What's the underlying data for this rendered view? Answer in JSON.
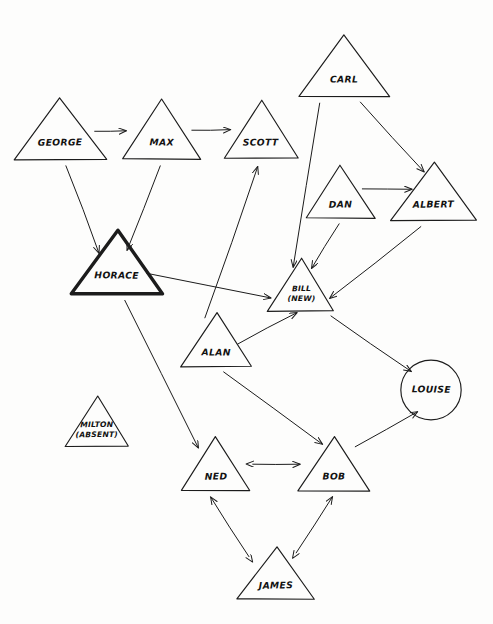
{
  "diagram": {
    "kind": "hand-drawn-sociogram",
    "background_color": "#fdfdfc",
    "ink_color": "#1c1c1c",
    "highlight_stroke_color": "#1c1c1c",
    "nodes": [
      {
        "id": "george",
        "label": "GEORGE",
        "label2": "",
        "shape": "triangle",
        "cx": 60,
        "cy": 135,
        "half_width": 46,
        "height": 62,
        "highlight": false
      },
      {
        "id": "max",
        "label": "MAX",
        "label2": "",
        "shape": "triangle",
        "cx": 162,
        "cy": 135,
        "half_width": 39,
        "height": 60,
        "highlight": false
      },
      {
        "id": "scott",
        "label": "SCOTT",
        "label2": "",
        "shape": "triangle",
        "cx": 261,
        "cy": 135,
        "half_width": 37,
        "height": 58,
        "highlight": false
      },
      {
        "id": "carl",
        "label": "CARL",
        "label2": "",
        "shape": "triangle",
        "cx": 344,
        "cy": 72,
        "half_width": 45,
        "height": 62,
        "highlight": false
      },
      {
        "id": "dan",
        "label": "DAN",
        "label2": "",
        "shape": "triangle",
        "cx": 341,
        "cy": 197,
        "half_width": 34,
        "height": 53,
        "highlight": false
      },
      {
        "id": "albert",
        "label": "ALBERT",
        "label2": "",
        "shape": "triangle",
        "cx": 434,
        "cy": 197,
        "half_width": 43,
        "height": 58,
        "highlight": false
      },
      {
        "id": "horace",
        "label": "HORACE",
        "label2": "",
        "shape": "triangle",
        "cx": 117,
        "cy": 268,
        "half_width": 45,
        "height": 63,
        "highlight": true
      },
      {
        "id": "bill",
        "label": "BILL",
        "label2": "(NEW)",
        "shape": "triangle",
        "cx": 301,
        "cy": 290,
        "half_width": 33,
        "height": 53,
        "highlight": false
      },
      {
        "id": "alan",
        "label": "ALAN",
        "label2": "",
        "shape": "triangle",
        "cx": 216,
        "cy": 345,
        "half_width": 35,
        "height": 54,
        "highlight": false
      },
      {
        "id": "louise",
        "label": "LOUISE",
        "label2": "",
        "shape": "circle",
        "cx": 431,
        "cy": 390,
        "radius": 30,
        "highlight": false
      },
      {
        "id": "milton",
        "label": "MILTON",
        "label2": "(ABSENT)",
        "shape": "triangle",
        "cx": 97,
        "cy": 426,
        "half_width": 32,
        "height": 50,
        "highlight": false
      },
      {
        "id": "ned",
        "label": "NED",
        "label2": "",
        "shape": "triangle",
        "cx": 216,
        "cy": 469,
        "half_width": 34,
        "height": 54,
        "highlight": false
      },
      {
        "id": "bob",
        "label": "BOB",
        "label2": "",
        "shape": "triangle",
        "cx": 334,
        "cy": 469,
        "half_width": 36,
        "height": 54,
        "highlight": false
      },
      {
        "id": "james",
        "label": "JAMES",
        "label2": "",
        "shape": "triangle",
        "cx": 276,
        "cy": 578,
        "half_width": 39,
        "height": 52,
        "highlight": false
      }
    ],
    "edges": [
      {
        "id": "george-max",
        "from": "george",
        "to": "max",
        "direction": "one-way",
        "x1": 95,
        "y1": 131,
        "x2": 126,
        "y2": 131
      },
      {
        "id": "max-scott",
        "from": "max",
        "to": "scott",
        "direction": "one-way",
        "x1": 192,
        "y1": 130,
        "x2": 230,
        "y2": 130
      },
      {
        "id": "george-horace",
        "from": "george",
        "to": "horace",
        "direction": "one-way",
        "x1": 66,
        "y1": 166,
        "x2": 99,
        "y2": 253
      },
      {
        "id": "max-horace",
        "from": "max",
        "to": "horace",
        "direction": "one-way",
        "x1": 160,
        "y1": 166,
        "x2": 127,
        "y2": 250
      },
      {
        "id": "carl-albert",
        "from": "carl",
        "to": "albert",
        "direction": "one-way",
        "x1": 360,
        "y1": 102,
        "x2": 424,
        "y2": 172
      },
      {
        "id": "carl-bill",
        "from": "carl",
        "to": "bill",
        "direction": "one-way",
        "x1": 320,
        "y1": 103,
        "x2": 293,
        "y2": 267
      },
      {
        "id": "dan-albert",
        "from": "dan",
        "to": "albert",
        "direction": "one-way",
        "x1": 362,
        "y1": 189,
        "x2": 412,
        "y2": 189
      },
      {
        "id": "dan-bill",
        "from": "dan",
        "to": "bill",
        "direction": "one-way",
        "x1": 339,
        "y1": 224,
        "x2": 312,
        "y2": 268
      },
      {
        "id": "albert-bill",
        "from": "albert",
        "to": "bill",
        "direction": "one-way",
        "x1": 421,
        "y1": 227,
        "x2": 330,
        "y2": 298
      },
      {
        "id": "horace-bill",
        "from": "horace",
        "to": "bill",
        "direction": "one-way",
        "x1": 147,
        "y1": 273,
        "x2": 271,
        "y2": 298
      },
      {
        "id": "horace-ned",
        "from": "horace",
        "to": "ned",
        "direction": "one-way",
        "x1": 125,
        "y1": 300,
        "x2": 198,
        "y2": 448
      },
      {
        "id": "alan-scott",
        "from": "alan",
        "to": "scott",
        "direction": "one-way",
        "x1": 205,
        "y1": 318,
        "x2": 258,
        "y2": 167
      },
      {
        "id": "alan-bill",
        "from": "alan",
        "to": "bill",
        "direction": "one-way",
        "x1": 238,
        "y1": 344,
        "x2": 297,
        "y2": 313
      },
      {
        "id": "alan-bob",
        "from": "alan",
        "to": "bob",
        "direction": "one-way",
        "x1": 224,
        "y1": 372,
        "x2": 322,
        "y2": 444
      },
      {
        "id": "bill-louise",
        "from": "bill",
        "to": "louise",
        "direction": "one-way",
        "x1": 331,
        "y1": 316,
        "x2": 411,
        "y2": 371
      },
      {
        "id": "bob-louise",
        "from": "bob",
        "to": "louise",
        "direction": "one-way",
        "x1": 355,
        "y1": 447,
        "x2": 417,
        "y2": 412
      },
      {
        "id": "ned-bob",
        "from": "ned",
        "to": "bob",
        "direction": "two-way",
        "x1": 253,
        "y1": 464,
        "x2": 300,
        "y2": 464
      },
      {
        "id": "james-ned",
        "from": "james",
        "to": "ned",
        "direction": "two-way",
        "x1": 249,
        "y1": 557,
        "x2": 211,
        "y2": 497
      },
      {
        "id": "james-bob",
        "from": "james",
        "to": "bob",
        "direction": "two-way",
        "x1": 296,
        "y1": 553,
        "x2": 332,
        "y2": 497
      }
    ]
  }
}
